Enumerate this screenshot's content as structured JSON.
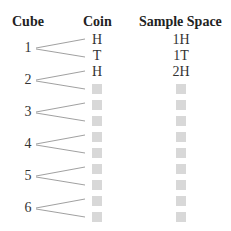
{
  "headers": {
    "cube": "Cube",
    "coin": "Coin",
    "sample_space": "Sample Space"
  },
  "cubes": [
    "1",
    "2",
    "3",
    "4",
    "5",
    "6"
  ],
  "coin_rows": [
    "H",
    "T",
    "H",
    "",
    "",
    "",
    "",
    "",
    "",
    "",
    "",
    ""
  ],
  "sample_rows": [
    "1H",
    "1T",
    "2H",
    "",
    "",
    "",
    "",
    "",
    "",
    "",
    "",
    ""
  ],
  "blank_color": "#d8d8d8"
}
